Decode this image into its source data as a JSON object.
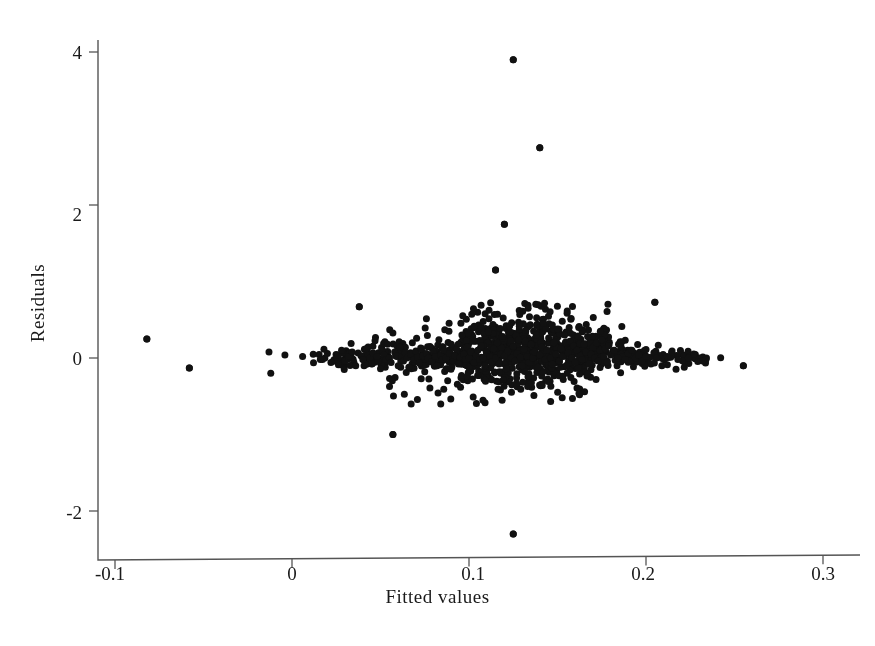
{
  "chart_data": {
    "type": "scatter",
    "title": "",
    "xlabel": "Fitted values",
    "ylabel": "Residuals",
    "xlim": [
      -0.118,
      0.315
    ],
    "ylim": [
      -2.78,
      4.38
    ],
    "xticks": [
      -0.1,
      0,
      0.1,
      0.2,
      0.3
    ],
    "xticklabels": [
      "-0.1",
      "0",
      "0.1",
      "0.2",
      "0.3"
    ],
    "yticks": [
      -2,
      0,
      2,
      4
    ],
    "yticklabels": [
      "-2",
      "0",
      "2",
      "4"
    ],
    "grid": false,
    "legend": null,
    "marker": "filled-circle",
    "marker_color": "#111111",
    "marker_size_px": 7,
    "n_points": 934,
    "notable_points": [
      {
        "x": 0.125,
        "y": 3.9
      },
      {
        "x": 0.14,
        "y": 2.75
      },
      {
        "x": 0.12,
        "y": 1.75
      },
      {
        "x": 0.115,
        "y": 1.15
      },
      {
        "x": 0.125,
        "y": -2.3
      },
      {
        "x": 0.057,
        "y": -1.0
      },
      {
        "x": 0.205,
        "y": 0.73
      },
      {
        "x": 0.038,
        "y": 0.67
      },
      {
        "x": -0.082,
        "y": 0.25
      },
      {
        "x": -0.058,
        "y": -0.13
      },
      {
        "x": 0.255,
        "y": -0.1
      }
    ],
    "points": [
      [
        -0.082,
        0.25
      ],
      [
        -0.058,
        -0.13
      ],
      [
        -0.013,
        0.08
      ],
      [
        -0.012,
        -0.2
      ],
      [
        -0.004,
        0.04
      ],
      [
        0.006,
        0.02
      ],
      [
        0.012,
        0.05
      ],
      [
        0.016,
        -0.02
      ],
      [
        0.02,
        0.06
      ],
      [
        0.022,
        -0.06
      ],
      [
        0.026,
        0.04
      ],
      [
        0.028,
        0.1
      ],
      [
        0.03,
        -0.04
      ],
      [
        0.032,
        0.02
      ],
      [
        0.034,
        0.08
      ],
      [
        0.036,
        -0.1
      ],
      [
        0.038,
        0.67
      ],
      [
        0.039,
        0.03
      ],
      [
        0.04,
        -0.02
      ],
      [
        0.042,
        0.12
      ],
      [
        0.044,
        0.0
      ],
      [
        0.045,
        -0.08
      ],
      [
        0.046,
        0.06
      ],
      [
        0.048,
        0.02
      ],
      [
        0.05,
        -0.14
      ],
      [
        0.051,
        0.1
      ],
      [
        0.052,
        0.04
      ],
      [
        0.053,
        -0.02
      ],
      [
        0.054,
        0.18
      ],
      [
        0.055,
        0.0
      ],
      [
        0.056,
        -0.06
      ],
      [
        0.057,
        -1.0
      ],
      [
        0.058,
        0.08
      ],
      [
        0.059,
        0.03
      ],
      [
        0.06,
        -0.1
      ],
      [
        0.061,
        0.14
      ],
      [
        0.062,
        0.02
      ],
      [
        0.063,
        -0.04
      ],
      [
        0.064,
        0.07
      ],
      [
        0.065,
        0.0
      ],
      [
        0.066,
        -0.12
      ],
      [
        0.067,
        0.05
      ],
      [
        0.068,
        0.2
      ],
      [
        0.069,
        -0.02
      ],
      [
        0.07,
        0.09
      ],
      [
        0.071,
        0.01
      ],
      [
        0.072,
        -0.07
      ],
      [
        0.073,
        0.12
      ],
      [
        0.074,
        0.03
      ],
      [
        0.075,
        -0.18
      ],
      [
        0.076,
        0.06
      ],
      [
        0.077,
        0.0
      ],
      [
        0.078,
        0.15
      ],
      [
        0.079,
        -0.05
      ],
      [
        0.08,
        0.08
      ],
      [
        0.081,
        0.02
      ],
      [
        0.082,
        -0.1
      ],
      [
        0.083,
        0.24
      ],
      [
        0.084,
        0.04
      ],
      [
        0.085,
        -0.02
      ],
      [
        0.086,
        0.1
      ],
      [
        0.087,
        0.0
      ],
      [
        0.088,
        -0.14
      ],
      [
        0.089,
        0.06
      ],
      [
        0.09,
        0.18
      ],
      [
        0.091,
        -0.04
      ],
      [
        0.092,
        0.03
      ],
      [
        0.093,
        0.11
      ],
      [
        0.094,
        -0.08
      ],
      [
        0.095,
        0.01
      ],
      [
        0.096,
        0.3
      ],
      [
        0.097,
        0.05
      ],
      [
        0.098,
        -0.02
      ],
      [
        0.099,
        0.14
      ],
      [
        0.1,
        0.0
      ],
      [
        0.1,
        -0.12
      ],
      [
        0.101,
        0.08
      ],
      [
        0.102,
        0.22
      ],
      [
        0.103,
        -0.06
      ],
      [
        0.104,
        0.04
      ],
      [
        0.105,
        0.1
      ],
      [
        0.106,
        -0.02
      ],
      [
        0.107,
        0.16
      ],
      [
        0.108,
        0.0
      ],
      [
        0.109,
        -0.1
      ],
      [
        0.11,
        0.07
      ],
      [
        0.111,
        0.34
      ],
      [
        0.112,
        0.02
      ],
      [
        0.113,
        -0.05
      ],
      [
        0.114,
        0.12
      ],
      [
        0.115,
        1.15
      ],
      [
        0.115,
        0.0
      ],
      [
        0.116,
        0.2
      ],
      [
        0.117,
        -0.08
      ],
      [
        0.118,
        0.05
      ],
      [
        0.119,
        0.28
      ],
      [
        0.12,
        1.75
      ],
      [
        0.12,
        0.03
      ],
      [
        0.121,
        -0.14
      ],
      [
        0.122,
        0.09
      ],
      [
        0.123,
        0.42
      ],
      [
        0.124,
        0.0
      ],
      [
        0.125,
        3.9
      ],
      [
        0.125,
        -2.3
      ],
      [
        0.125,
        0.15
      ],
      [
        0.126,
        -0.04
      ],
      [
        0.127,
        0.06
      ],
      [
        0.128,
        0.24
      ],
      [
        0.129,
        0.01
      ],
      [
        0.13,
        -0.1
      ],
      [
        0.131,
        0.11
      ],
      [
        0.132,
        0.36
      ],
      [
        0.133,
        0.02
      ],
      [
        0.134,
        -0.06
      ],
      [
        0.135,
        0.18
      ],
      [
        0.136,
        0.0
      ],
      [
        0.137,
        0.08
      ],
      [
        0.138,
        0.3
      ],
      [
        0.139,
        -0.12
      ],
      [
        0.14,
        2.75
      ],
      [
        0.14,
        0.04
      ],
      [
        0.141,
        0.14
      ],
      [
        0.142,
        0.45
      ],
      [
        0.143,
        -0.02
      ],
      [
        0.144,
        0.1
      ],
      [
        0.145,
        0.26
      ],
      [
        0.146,
        0.0
      ],
      [
        0.147,
        -0.08
      ],
      [
        0.148,
        0.2
      ],
      [
        0.149,
        0.05
      ],
      [
        0.15,
        0.38
      ],
      [
        0.151,
        -0.04
      ],
      [
        0.152,
        0.12
      ],
      [
        0.153,
        0.02
      ],
      [
        0.154,
        0.3
      ],
      [
        0.155,
        -0.1
      ],
      [
        0.156,
        0.07
      ],
      [
        0.157,
        0.22
      ],
      [
        0.158,
        0.0
      ],
      [
        0.159,
        0.16
      ],
      [
        0.16,
        -0.06
      ],
      [
        0.161,
        0.1
      ],
      [
        0.162,
        0.4
      ],
      [
        0.163,
        0.03
      ],
      [
        0.164,
        -0.02
      ],
      [
        0.165,
        0.18
      ],
      [
        0.166,
        0.08
      ],
      [
        0.167,
        0.28
      ],
      [
        0.168,
        -0.08
      ],
      [
        0.169,
        0.05
      ],
      [
        0.17,
        0.14
      ],
      [
        0.171,
        0.0
      ],
      [
        0.172,
        0.2
      ],
      [
        0.173,
        -0.04
      ],
      [
        0.174,
        0.1
      ],
      [
        0.175,
        0.24
      ],
      [
        0.176,
        0.02
      ],
      [
        0.177,
        0.12
      ],
      [
        0.178,
        -0.06
      ],
      [
        0.179,
        0.16
      ],
      [
        0.18,
        0.04
      ],
      [
        0.182,
        0.1
      ],
      [
        0.184,
        0.0
      ],
      [
        0.186,
        0.14
      ],
      [
        0.188,
        -0.02
      ],
      [
        0.19,
        0.06
      ],
      [
        0.192,
        0.1
      ],
      [
        0.194,
        0.0
      ],
      [
        0.196,
        0.04
      ],
      [
        0.198,
        -0.04
      ],
      [
        0.2,
        0.02
      ],
      [
        0.205,
        0.73
      ],
      [
        0.206,
        0.0
      ],
      [
        0.212,
        0.02
      ],
      [
        0.218,
        -0.02
      ],
      [
        0.224,
        0.0
      ],
      [
        0.232,
        -0.04
      ],
      [
        0.255,
        -0.1
      ]
    ]
  },
  "axis": {
    "x_title": "Fitted values",
    "y_title": "Residuals",
    "xtick_labels": [
      "-0.1",
      "0",
      "0.1",
      "0.2",
      "0.3"
    ],
    "ytick_labels": [
      "4",
      "2",
      "0",
      "-2"
    ],
    "spine_color": "#555555"
  }
}
